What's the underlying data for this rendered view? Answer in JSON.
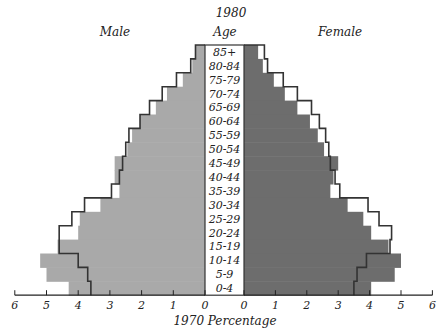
{
  "labels": {
    "title_1980": "1980",
    "male": "Male",
    "age": "Age",
    "female": "Female",
    "xlabel": "1970  Percentage"
  },
  "colors": {
    "male_fill": "#a9a9a9",
    "female_fill": "#6d6d6d",
    "outline": "#333333",
    "age_box": "#ffffff"
  },
  "chart_data": {
    "type": "bar",
    "subtype": "population-pyramid",
    "title": "1980",
    "xlabel": "1970  Percentage",
    "ylabel": "Age",
    "legend": [
      "1980 (filled bars)",
      "1970 (outline)"
    ],
    "xlim": [
      -6,
      6
    ],
    "x_ticks": [
      6,
      5,
      4,
      3,
      2,
      1,
      0,
      0,
      1,
      2,
      3,
      4,
      5,
      6
    ],
    "grid": false,
    "categories": [
      "85+",
      "80-84",
      "75-79",
      "70-74",
      "65-69",
      "60-64",
      "55-59",
      "50-54",
      "45-49",
      "40-44",
      "35-39",
      "30-34",
      "25-29",
      "20-24",
      "15-19",
      "10-14",
      "5-9",
      "0-4"
    ],
    "series": [
      {
        "name": "Male 1980",
        "side": "left",
        "style": "filled",
        "values": [
          0.3,
          0.4,
          0.7,
          1.2,
          1.55,
          2.05,
          2.3,
          2.45,
          2.85,
          2.85,
          2.7,
          3.3,
          3.95,
          4.0,
          4.65,
          5.2,
          5.0,
          4.3
        ]
      },
      {
        "name": "Male 1970",
        "side": "left",
        "style": "outline",
        "values": [
          0.3,
          0.45,
          0.9,
          1.35,
          1.75,
          2.05,
          2.4,
          2.5,
          2.6,
          2.7,
          2.95,
          3.8,
          4.2,
          4.6,
          4.6,
          4.0,
          3.7,
          3.6
        ]
      },
      {
        "name": "Female 1980",
        "side": "right",
        "style": "filled",
        "values": [
          0.45,
          0.6,
          0.95,
          1.3,
          1.7,
          2.1,
          2.35,
          2.55,
          3.0,
          2.85,
          2.75,
          3.3,
          3.8,
          4.05,
          4.6,
          5.0,
          4.8,
          4.05
        ]
      },
      {
        "name": "Female 1970",
        "side": "right",
        "style": "outline",
        "values": [
          0.65,
          0.75,
          1.25,
          1.7,
          2.15,
          2.4,
          2.6,
          2.7,
          2.75,
          2.9,
          3.05,
          3.95,
          4.3,
          4.7,
          4.65,
          3.9,
          3.6,
          3.5
        ]
      }
    ]
  }
}
